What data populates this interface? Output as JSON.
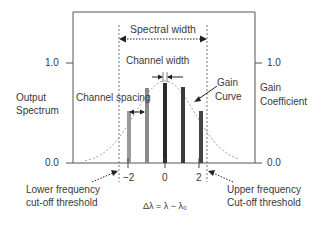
{
  "diagram": {
    "title_labels": {
      "spectral_width": "Spectral width",
      "channel_width": "Channel width",
      "channel_spacing": "Channel spacing",
      "gain_curve_1": "Gain",
      "gain_curve_2": "Curve"
    },
    "left_axis": {
      "label_1": "Output",
      "label_2": "Spectrum",
      "tick_top": "1.0",
      "tick_bottom": "0.0"
    },
    "right_axis": {
      "label_1": "Gain",
      "label_2": "Coefficient",
      "tick_top": "1.0",
      "tick_bottom": "0.0"
    },
    "x_axis": {
      "ticks": [
        "−2",
        "0",
        "2"
      ],
      "label": "Δλ = λ − λ₀"
    },
    "thresholds": {
      "lower_1": "Lower frequency",
      "lower_2": "cut-off threshold",
      "upper_1": "Upper frequency",
      "upper_2": "Cut-off threshold"
    },
    "channels": [
      {
        "x": -2,
        "value": 0.52,
        "color": "#9a9a9a"
      },
      {
        "x": -1,
        "value": 0.75,
        "color": "#8a8a8a"
      },
      {
        "x": 0,
        "value": 0.8,
        "color": "#2a2a2a"
      },
      {
        "x": 1,
        "value": 0.76,
        "color": "#3a3a3a"
      },
      {
        "x": 2,
        "value": 0.52,
        "color": "#444444"
      }
    ]
  }
}
